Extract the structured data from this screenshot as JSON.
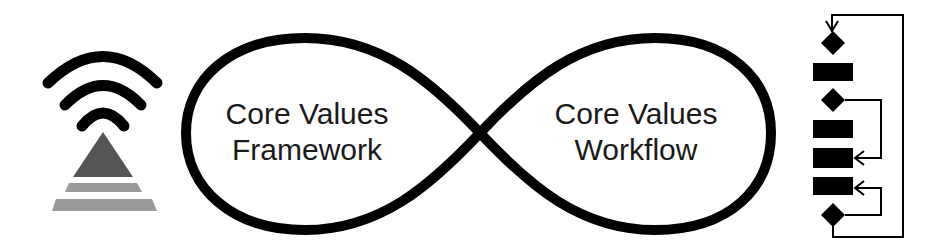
{
  "diagram": {
    "left_icon": {
      "name": "signal-pyramid-icon"
    },
    "infinity_loop": {
      "left": {
        "line1": "Core Values",
        "line2": "Framework"
      },
      "right": {
        "line1": "Core Values",
        "line2": "Workflow"
      }
    },
    "right_icon": {
      "name": "workflow-flowchart-icon"
    },
    "colors": {
      "stroke": "#000000",
      "triangle": "#555555",
      "stripes": "#9a9a9a",
      "text": "#1a1a1a",
      "background": "#ffffff"
    }
  }
}
